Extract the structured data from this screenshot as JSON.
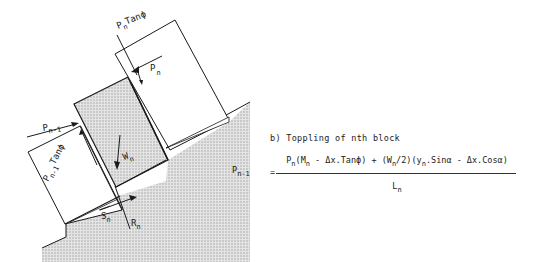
{
  "diagram": {
    "labels": {
      "pn_tanphi": {
        "main": "P",
        "sub": "n",
        "suffix": "Tanϕ"
      },
      "pn": {
        "main": "P",
        "sub": "n"
      },
      "pn1": {
        "main": "P",
        "sub": "n-1"
      },
      "pn1_tanphi": {
        "main": "P",
        "sub": "n-1",
        "suffix": "Tanϕ"
      },
      "wn": {
        "main": "W",
        "sub": "n"
      },
      "sn": {
        "main": "S",
        "sub": "n"
      },
      "rn": {
        "main": "R",
        "sub": "n"
      }
    },
    "colors": {
      "line": "#1a1a1a",
      "hatch": "#bdbdbd",
      "background": "#ffffff"
    }
  },
  "caption": "b) Toppling of nth block",
  "formula": {
    "lhs_main": "P",
    "lhs_sub": "n-1",
    "equals": "=",
    "numerator": {
      "p": "P",
      "p_sub": "n",
      "part1": "(M",
      "m_sub": "n",
      "part2": " - Δx.Tanϕ) + (W",
      "w_sub": "n",
      "part3": "/2)(y",
      "y_sub": "n",
      "part4": ".Sinα - Δx.Cosα)"
    },
    "denominator": {
      "main": "L",
      "sub": "n"
    }
  }
}
